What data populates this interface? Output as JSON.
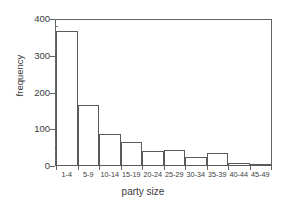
{
  "chart_data": {
    "type": "bar",
    "title": "",
    "xlabel": "party size",
    "ylabel": "frequency",
    "categories": [
      "1-4",
      "5-9",
      "10-14",
      "15-19",
      "20-24",
      "25-29",
      "30-34",
      "35-39",
      "40-44",
      "45-49"
    ],
    "values": [
      370,
      166,
      87,
      65,
      41,
      44,
      25,
      36,
      7,
      6
    ],
    "ylim": [
      0,
      400
    ],
    "yticks": [
      0,
      100,
      200,
      300,
      400
    ],
    "ytick_labels": [
      "0",
      "100",
      "200",
      "300",
      "400"
    ],
    "yminor_step": 20,
    "grid": false,
    "legend": null,
    "bar_fill_color": "#ffffff",
    "bar_edge_color": "#5a5a5a",
    "axis_color": "#636363",
    "text_color": "#3a3a3a",
    "background_color": "#ffffff"
  }
}
